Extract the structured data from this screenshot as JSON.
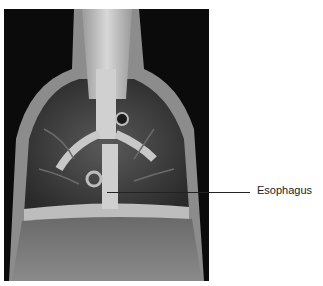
{
  "figure": {
    "labels": [
      {
        "text": "Esophagus"
      }
    ]
  }
}
